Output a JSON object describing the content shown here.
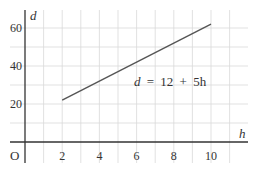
{
  "chart_data": {
    "type": "line",
    "title": "",
    "xlabel": "h",
    "ylabel": "d",
    "origin_label": "O",
    "equation_label": "d = 12 + 5h",
    "equation_parts": {
      "lhs": "d",
      "eq": "=",
      "c": "12",
      "plus": "+",
      "term": "5h"
    },
    "x_ticks": [
      "2",
      "4",
      "6",
      "8",
      "10"
    ],
    "y_ticks": [
      "20",
      "40",
      "60"
    ],
    "xlim": [
      0,
      11.5
    ],
    "ylim": [
      0,
      65
    ],
    "grid": true,
    "grid_x_step": 1,
    "grid_y_step": 10,
    "series": [
      {
        "name": "d = 12 + 5h",
        "x": [
          2,
          10
        ],
        "y": [
          22,
          62
        ]
      }
    ],
    "colors": {
      "line": "#555555",
      "grid": "#d9d9d9",
      "axis": "#333333"
    }
  }
}
